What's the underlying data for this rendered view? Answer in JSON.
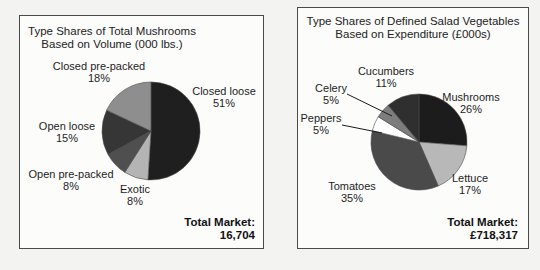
{
  "page": {
    "background_color": "#f3f3f1",
    "panel_border_color": "#4a4a4a"
  },
  "chart_data": [
    {
      "type": "pie",
      "title": "Type Shares of Total Mushrooms",
      "subtitle": "Based on Volume (000 lbs.)",
      "labels": [
        "Closed loose",
        "Exotic",
        "Open pre-packed",
        "Open loose",
        "Closed pre-packed"
      ],
      "values": [
        51,
        8,
        8,
        15,
        18
      ],
      "percent_labels": [
        "51%",
        "8%",
        "8%",
        "15%",
        "18%"
      ],
      "colors": [
        "#1f1f1f",
        "#b4b4b4",
        "#4f4f4f",
        "#363636",
        "#8e8e8e"
      ],
      "start_angle_deg": 0,
      "direction": "clockwise",
      "legend": "none, labels placed around pie",
      "total_label": "Total Market:",
      "total_value": "16,704"
    },
    {
      "type": "pie",
      "title": "Type Shares of Defined Salad Vegetables",
      "subtitle": "Based on Expenditure (£000s)",
      "labels": [
        "Mushrooms",
        "Lettuce",
        "Tomatoes",
        "Peppers",
        "Celery",
        "Cucumbers"
      ],
      "values": [
        26,
        17,
        35,
        5,
        5,
        11
      ],
      "percent_labels": [
        "26%",
        "17%",
        "35%",
        "5%",
        "5%",
        "11%"
      ],
      "colors": [
        "#1c1c1c",
        "#b8b8b8",
        "#4a4a4a",
        "#ffffff",
        "#7d7d7d",
        "#2f2f2f"
      ],
      "start_angle_deg": 0,
      "direction": "clockwise",
      "legend": "none, labels placed around pie; Celery and Peppers use leader lines",
      "total_label": "Total Market:",
      "total_value": "£718,317"
    }
  ]
}
